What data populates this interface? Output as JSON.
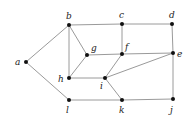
{
  "diagram": {
    "type": "undirected-graph",
    "colors": {
      "edge": "#9a9a9a",
      "node": "#111111",
      "label": "#222222",
      "background": "#ffffff"
    },
    "nodes": [
      {
        "id": "a",
        "label": "a",
        "x": 26,
        "y": 62,
        "lx": 15,
        "ly": 65
      },
      {
        "id": "b",
        "label": "b",
        "x": 69,
        "y": 25,
        "lx": 66,
        "ly": 19
      },
      {
        "id": "c",
        "label": "c",
        "x": 122,
        "y": 24,
        "lx": 119,
        "ly": 18
      },
      {
        "id": "d",
        "label": "d",
        "x": 172,
        "y": 24,
        "lx": 169,
        "ly": 18
      },
      {
        "id": "g",
        "label": "g",
        "x": 87,
        "y": 55,
        "lx": 91,
        "ly": 51
      },
      {
        "id": "f",
        "label": "f",
        "x": 122,
        "y": 54,
        "lx": 125,
        "ly": 50
      },
      {
        "id": "e",
        "label": "e",
        "x": 173,
        "y": 53,
        "lx": 177,
        "ly": 57
      },
      {
        "id": "h",
        "label": "h",
        "x": 69,
        "y": 78,
        "lx": 58,
        "ly": 82
      },
      {
        "id": "i",
        "label": "i",
        "x": 105,
        "y": 78,
        "lx": 100,
        "ly": 89
      },
      {
        "id": "l",
        "label": "l",
        "x": 69,
        "y": 100,
        "lx": 66,
        "ly": 113
      },
      {
        "id": "k",
        "label": "k",
        "x": 122,
        "y": 100,
        "lx": 119,
        "ly": 113
      },
      {
        "id": "j",
        "label": "j",
        "x": 173,
        "y": 99,
        "lx": 170,
        "ly": 113
      }
    ],
    "edges": [
      [
        "a",
        "b"
      ],
      [
        "a",
        "l"
      ],
      [
        "b",
        "c"
      ],
      [
        "c",
        "d"
      ],
      [
        "b",
        "g"
      ],
      [
        "b",
        "h"
      ],
      [
        "c",
        "f"
      ],
      [
        "d",
        "e"
      ],
      [
        "g",
        "f"
      ],
      [
        "f",
        "e"
      ],
      [
        "g",
        "h"
      ],
      [
        "h",
        "i"
      ],
      [
        "f",
        "i"
      ],
      [
        "i",
        "e"
      ],
      [
        "i",
        "k"
      ],
      [
        "l",
        "k"
      ],
      [
        "k",
        "j"
      ],
      [
        "e",
        "j"
      ]
    ]
  }
}
